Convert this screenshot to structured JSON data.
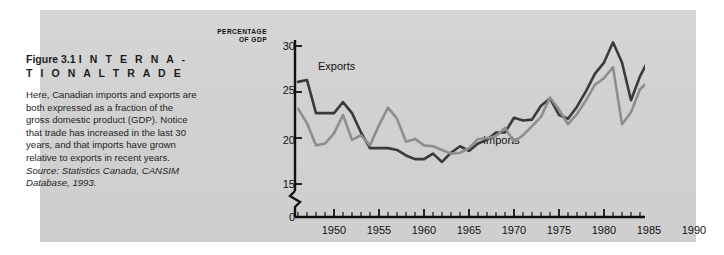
{
  "figure": {
    "heading_number": "Figure 3.1",
    "heading_title": "I N T E R N A -",
    "heading_title_line2": "T I O N A L   T R A D E",
    "body": "Here, Canadian imports and exports are both expressed as a fraction of the gross domestic product (GDP). Notice that trade has increased in the last 30 years, and that imports have grown relative to exports in recent years. ",
    "source": "Source: Statistics Canada, CANSIM Database, 1993."
  },
  "axis_title": {
    "line1": "PERCENTAGE",
    "line2": "OF GDP"
  },
  "colors": {
    "panel_background": "#d2d2d2",
    "page_background": "#ffffff",
    "axis": "#111111",
    "exports_line": "#3a3a3a",
    "imports_line": "#8e8e8e",
    "text": "#1b1b1b"
  },
  "chart_data": {
    "type": "line",
    "title": "",
    "xlabel": "",
    "ylabel": "PERCENTAGE OF GDP",
    "ylim": [
      15,
      31
    ],
    "xlim": [
      1946,
      1992
    ],
    "grid": false,
    "legend": "inline-annotations",
    "y_ticks": [
      30,
      25,
      20,
      15,
      0
    ],
    "y_axis_break_between": [
      15,
      0
    ],
    "x_ticks": [
      1950,
      1955,
      1960,
      1965,
      1970,
      1975,
      1980,
      1985,
      1990
    ],
    "x_tick_interval_minor": 1,
    "x": [
      1946,
      1947,
      1948,
      1949,
      1950,
      1951,
      1952,
      1953,
      1954,
      1955,
      1956,
      1957,
      1958,
      1959,
      1960,
      1961,
      1962,
      1963,
      1964,
      1965,
      1966,
      1967,
      1968,
      1969,
      1970,
      1971,
      1972,
      1973,
      1974,
      1975,
      1976,
      1977,
      1978,
      1979,
      1980,
      1981,
      1982,
      1983,
      1984,
      1985,
      1986,
      1987,
      1988,
      1989,
      1990,
      1991,
      1992
    ],
    "series": [
      {
        "name": "Exports",
        "color": "#3a3a3a",
        "values": [
          26.1,
          26.3,
          22.7,
          22.7,
          22.7,
          23.9,
          22.7,
          20.6,
          18.9,
          18.9,
          18.9,
          18.7,
          18.1,
          17.7,
          17.7,
          18.3,
          17.4,
          18.4,
          19.1,
          18.6,
          19.4,
          19.8,
          20.6,
          20.6,
          22.2,
          21.9,
          22.0,
          23.5,
          24.3,
          22.5,
          22.1,
          23.4,
          25.1,
          27.0,
          28.2,
          30.4,
          28.2,
          24.1,
          26.7,
          28.6,
          28.0,
          27.5,
          27.6,
          26.6,
          25.8,
          25.3,
          25.0
        ],
        "annotation": {
          "text": "Exports",
          "x": 1949,
          "y": 27.2
        }
      },
      {
        "name": "Imports",
        "color": "#8e8e8e",
        "values": [
          23.2,
          21.6,
          19.2,
          19.4,
          20.5,
          22.5,
          19.8,
          20.3,
          19.2,
          21.4,
          23.3,
          22.1,
          19.6,
          19.9,
          19.2,
          19.1,
          18.7,
          18.3,
          18.4,
          18.9,
          19.9,
          20.0,
          20.2,
          21.1,
          19.6,
          20.3,
          21.3,
          22.3,
          24.4,
          23.1,
          21.5,
          22.6,
          24.1,
          25.8,
          26.5,
          27.7,
          21.5,
          22.8,
          25.3,
          26.2,
          26.4,
          26.0,
          26.3,
          25.5,
          25.3,
          25.1,
          25.4
        ],
        "annotation": {
          "text": "Imports",
          "x": 1972,
          "y": 19.6
        }
      }
    ]
  }
}
